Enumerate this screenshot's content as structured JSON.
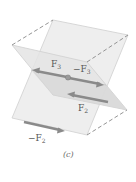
{
  "diagram": {
    "caption": "(c)",
    "labels": {
      "f3_main": "F",
      "f3_sub": "3",
      "neg_f3_main": "−F",
      "neg_f3_sub": "3",
      "f2_main": "F",
      "f2_sub": "2",
      "neg_f2_main": "−F",
      "neg_f2_sub": "2"
    },
    "colors": {
      "plane_fill": "#e9e9e9",
      "plane_fill_shadow": "#d4d4d4",
      "edge": "#c8c8c8",
      "dashed_edge": "#888888",
      "arrow": "#8a8a8a",
      "center_point": "#9a9a9a",
      "label": "#555555"
    }
  }
}
